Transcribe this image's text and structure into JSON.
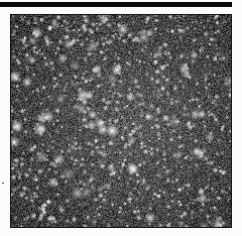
{
  "figure": {
    "type": "astronomical-image",
    "colormap": "grayscale",
    "colors": {
      "background": "#fbfbfb",
      "top_bar": "#0a0a0a",
      "frame_border": "#1a1a1a",
      "sky": "#2a2a2a",
      "stars": "#ffffff"
    },
    "star_count_estimate": 900,
    "seed": 7
  }
}
